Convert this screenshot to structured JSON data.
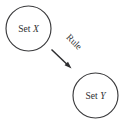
{
  "diagram": {
    "type": "node-edge-diagram",
    "background_color": "#ffffff",
    "stroke_color": "#3a3a3c",
    "text_color": "#303032",
    "nodes": [
      {
        "id": "set-x",
        "shape": "circle",
        "label_prefix": "Set ",
        "label_variable": "X",
        "label_full": "Set X",
        "cx": 28.5,
        "cy": 28.5,
        "r": 22.5
      },
      {
        "id": "set-y",
        "shape": "circle",
        "label_prefix": "Set ",
        "label_variable": "Y",
        "label_full": "Set Y",
        "cx": 95.5,
        "cy": 95.5,
        "r": 22.5
      }
    ],
    "edges": [
      {
        "id": "rule-arrow",
        "label": "Rule",
        "from": "set-x",
        "to": "set-y",
        "x1": 51.5,
        "y1": 49.5,
        "x2": 71.5,
        "y2": 68.5,
        "arrowhead": "filled-triangle",
        "label_rotation_deg": 45,
        "label_x": 72,
        "label_y": 44
      }
    ]
  }
}
